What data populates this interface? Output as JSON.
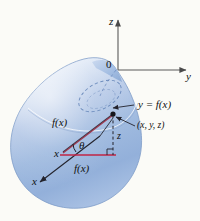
{
  "figure": {
    "name": "solid-of-revolution-cylindrical-shell-diagram",
    "background_color": "#fbfbf7",
    "solid_fill_light": "#e3ebf7",
    "solid_fill_mid": "#a9c0e2",
    "solid_fill_deep": "#8ba8d4",
    "axis_color": "#5a5a5a",
    "line_color": "#2a2a33",
    "accent_line_color": "#b03048",
    "labels": {
      "z_axis": "z",
      "y_axis": "y",
      "x_axis": "x",
      "origin": "0",
      "surface_equation": "y = f(x)",
      "point": "(x, y, z)",
      "radius_upper": "f(x)",
      "radius_lower": "f(x)",
      "theta": "θ",
      "height": "z",
      "x_inner": "x"
    }
  }
}
